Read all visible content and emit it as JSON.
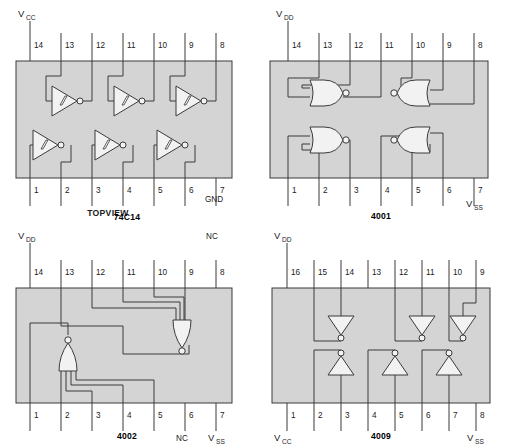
{
  "figure": {
    "title": "",
    "background_color": "#ffffff",
    "body_fill": "#d4d4d4",
    "line_color": "#3b3b3b",
    "gate_fill": "#f2f2f2",
    "text_color": "#1a1a1a"
  },
  "packages": [
    {
      "id": "74c14",
      "part_label": "74C14",
      "view_label": "TOPVIEW",
      "pin_count": 14,
      "gate_type": "schmitt-inverter",
      "gate_count": 6,
      "top_pins": [
        "14",
        "13",
        "12",
        "11",
        "10",
        "9",
        "8"
      ],
      "bottom_pins": [
        "1",
        "2",
        "3",
        "4",
        "5",
        "6",
        "7"
      ],
      "power_label": "V",
      "power_sub": "CC",
      "power_pin": "14",
      "ground_label": "GND",
      "ground_pin": "7",
      "gates": [
        {
          "name": "inverter-1",
          "inputs": [
            "1"
          ],
          "output": "2",
          "row": "bottom"
        },
        {
          "name": "inverter-2",
          "inputs": [
            "3"
          ],
          "output": "4",
          "row": "bottom"
        },
        {
          "name": "inverter-3",
          "inputs": [
            "5"
          ],
          "output": "6",
          "row": "bottom"
        },
        {
          "name": "inverter-4",
          "inputs": [
            "13"
          ],
          "output": "12",
          "row": "top"
        },
        {
          "name": "inverter-5",
          "inputs": [
            "11"
          ],
          "output": "10",
          "row": "top"
        },
        {
          "name": "inverter-6",
          "inputs": [
            "9"
          ],
          "output": "8",
          "row": "top"
        }
      ]
    },
    {
      "id": "4001",
      "part_label": "4001",
      "view_label": "",
      "pin_count": 14,
      "gate_type": "nor2",
      "gate_count": 4,
      "top_pins": [
        "14",
        "13",
        "12",
        "11",
        "10",
        "9",
        "8"
      ],
      "bottom_pins": [
        "1",
        "2",
        "3",
        "4",
        "5",
        "6",
        "7"
      ],
      "power_label": "V",
      "power_sub": "DD",
      "power_pin": "14",
      "ground_label": "V",
      "ground_sub": "SS",
      "ground_pin": "7",
      "gates": [
        {
          "name": "nor-1",
          "inputs": [
            "1",
            "2"
          ],
          "output": "3",
          "row": "bottom",
          "facing": "right"
        },
        {
          "name": "nor-2",
          "inputs": [
            "5",
            "6"
          ],
          "output": "4",
          "row": "bottom",
          "facing": "left"
        },
        {
          "name": "nor-3",
          "inputs": [
            "12",
            "13"
          ],
          "output": "11",
          "row": "top",
          "facing": "right"
        },
        {
          "name": "nor-4",
          "inputs": [
            "8",
            "9"
          ],
          "output": "10",
          "row": "top",
          "facing": "left"
        }
      ]
    },
    {
      "id": "4002",
      "part_label": "4002",
      "view_label": "",
      "pin_count": 14,
      "gate_type": "nor4",
      "gate_count": 2,
      "top_pins": [
        "14",
        "13",
        "12",
        "11",
        "10",
        "9",
        "8"
      ],
      "bottom_pins": [
        "1",
        "2",
        "3",
        "4",
        "5",
        "6",
        "7"
      ],
      "power_label": "V",
      "power_sub": "DD",
      "power_pin": "14",
      "ground_label": "V",
      "ground_sub": "SS",
      "ground_pin": "7",
      "nc_labels": [
        {
          "text": "NC",
          "pin": "8",
          "position": "top-right"
        },
        {
          "text": "NC",
          "pin": "6",
          "position": "bottom-right"
        }
      ],
      "gates": [
        {
          "name": "nor4-upper",
          "inputs": [
            "9",
            "10",
            "11",
            "12"
          ],
          "output": "13",
          "orientation": "down"
        },
        {
          "name": "nor4-lower",
          "inputs": [
            "2",
            "3",
            "4",
            "5"
          ],
          "output": "1",
          "orientation": "up"
        }
      ]
    },
    {
      "id": "4009",
      "part_label": "4009",
      "view_label": "",
      "pin_count": 16,
      "gate_type": "inverter",
      "gate_count": 6,
      "top_pins": [
        "16",
        "15",
        "14",
        "13",
        "12",
        "11",
        "10",
        "9"
      ],
      "bottom_pins": [
        "1",
        "2",
        "3",
        "4",
        "5",
        "6",
        "7",
        "8"
      ],
      "power_label": "V",
      "power_sub": "DD",
      "power_pin": "16",
      "vcc_label": "V",
      "vcc_sub": "CC",
      "vcc_pin": "1",
      "ground_label": "V",
      "ground_sub": "SS",
      "ground_pin": "8",
      "gates": [
        {
          "name": "inverter-1",
          "inputs": [
            "14"
          ],
          "output": "15",
          "row": "top",
          "orientation": "down"
        },
        {
          "name": "inverter-2",
          "inputs": [
            "11"
          ],
          "output": "12",
          "row": "top",
          "orientation": "down"
        },
        {
          "name": "inverter-3",
          "inputs": [
            "9"
          ],
          "output": "10",
          "row": "top",
          "orientation": "down"
        },
        {
          "name": "inverter-4",
          "inputs": [
            "3"
          ],
          "output": "2",
          "row": "bottom",
          "orientation": "up"
        },
        {
          "name": "inverter-5",
          "inputs": [
            "5"
          ],
          "output": "4",
          "row": "bottom",
          "orientation": "up"
        },
        {
          "name": "inverter-6",
          "inputs": [
            "7"
          ],
          "output": "6",
          "row": "bottom",
          "orientation": "up"
        }
      ]
    }
  ]
}
